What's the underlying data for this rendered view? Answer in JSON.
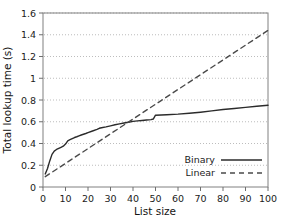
{
  "chart_data": {
    "type": "line",
    "title": "",
    "xlabel": "List size",
    "ylabel": "Total lookup time (s)",
    "xlim": [
      0,
      100
    ],
    "ylim": [
      0,
      1.6
    ],
    "xticks": [
      0,
      10,
      20,
      30,
      40,
      50,
      60,
      70,
      80,
      90,
      100
    ],
    "xtick_labels": [
      "0",
      "10",
      "20",
      "30",
      "40",
      "50",
      "60",
      "70",
      "80",
      "90",
      "100"
    ],
    "yticks": [
      0,
      0.2,
      0.4,
      0.6,
      0.8,
      1.0,
      1.2,
      1.4,
      1.6
    ],
    "ytick_labels": [
      "0",
      "0.2",
      "0.4",
      "0.6",
      "0.8",
      "1",
      "1.2",
      "1.4",
      "1.6"
    ],
    "grid": "horizontal-dotted",
    "legend_position": "lower-right",
    "series": [
      {
        "name": "Binary",
        "style": "solid",
        "color": "#2b2b2b",
        "x": [
          1,
          2,
          3,
          4,
          5,
          6,
          7,
          8,
          9,
          10,
          11,
          12,
          13,
          14,
          15,
          16,
          17,
          18,
          19,
          20,
          22,
          24,
          25,
          26,
          28,
          30,
          32,
          34,
          36,
          38,
          40,
          42,
          44,
          46,
          48,
          49,
          50,
          55,
          60,
          65,
          70,
          75,
          80,
          85,
          90,
          95,
          100
        ],
        "values": [
          0.12,
          0.17,
          0.24,
          0.3,
          0.33,
          0.345,
          0.355,
          0.365,
          0.375,
          0.395,
          0.425,
          0.435,
          0.445,
          0.455,
          0.462,
          0.47,
          0.478,
          0.485,
          0.492,
          0.5,
          0.515,
          0.53,
          0.54,
          0.545,
          0.553,
          0.562,
          0.572,
          0.58,
          0.588,
          0.596,
          0.603,
          0.608,
          0.612,
          0.616,
          0.62,
          0.625,
          0.66,
          0.665,
          0.67,
          0.678,
          0.688,
          0.7,
          0.712,
          0.722,
          0.732,
          0.742,
          0.752
        ]
      },
      {
        "name": "Linear",
        "style": "dashed",
        "color": "#4a4a4a",
        "x": [
          1,
          100
        ],
        "values": [
          0.095,
          1.44
        ]
      }
    ]
  },
  "legend": {
    "items": [
      {
        "label": "Binary",
        "style": "solid"
      },
      {
        "label": "Linear",
        "style": "dashed"
      }
    ]
  },
  "axes": {
    "x_label": "List size",
    "y_label": "Total lookup time (s)"
  }
}
